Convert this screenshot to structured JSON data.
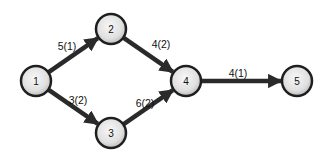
{
  "diagram": {
    "type": "network-activity-graph",
    "nodes": [
      {
        "id": "1",
        "label": "1"
      },
      {
        "id": "2",
        "label": "2"
      },
      {
        "id": "3",
        "label": "3"
      },
      {
        "id": "4",
        "label": "4"
      },
      {
        "id": "5",
        "label": "5"
      }
    ],
    "edges": [
      {
        "from": "1",
        "to": "2",
        "label": "5(1)"
      },
      {
        "from": "1",
        "to": "3",
        "label": "3(2)"
      },
      {
        "from": "2",
        "to": "4",
        "label": "4(2)"
      },
      {
        "from": "3",
        "to": "4",
        "label": "6(2)"
      },
      {
        "from": "4",
        "to": "5",
        "label": "4(1)"
      }
    ],
    "colors": {
      "edge": "#2a2a2a",
      "node_fill_light": "#f4f4f4",
      "node_fill_dark": "#c9c9c9",
      "node_stroke": "#1f1f1f"
    }
  }
}
